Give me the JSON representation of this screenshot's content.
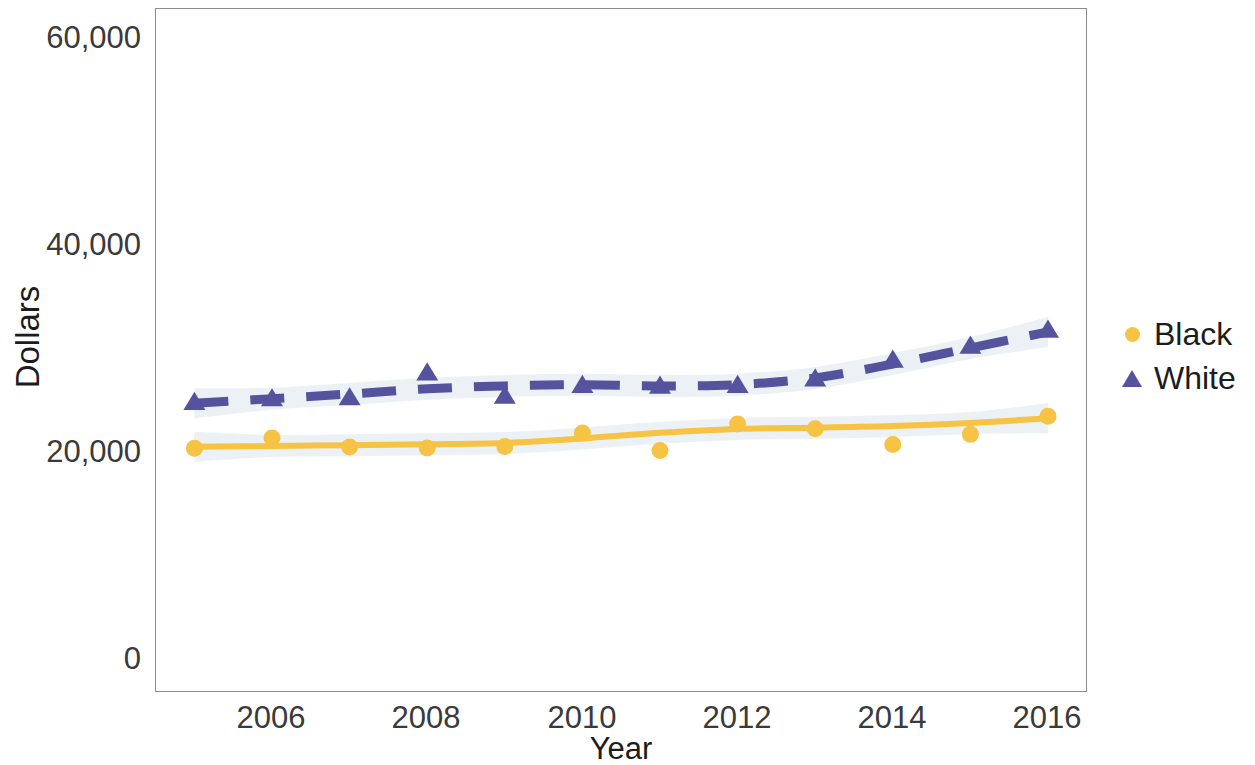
{
  "chart_data": {
    "type": "line",
    "title": "",
    "xlabel": "Year",
    "ylabel": "Dollars",
    "x": [
      2005,
      2006,
      2007,
      2008,
      2009,
      2010,
      2011,
      2012,
      2013,
      2014,
      2015,
      2016
    ],
    "xlim": [
      2004.5,
      2016.5
    ],
    "ylim": [
      0,
      62000
    ],
    "xticks": [
      "2006",
      "2008",
      "2010",
      "2012",
      "2014",
      "2016"
    ],
    "xtick_values": [
      2006,
      2008,
      2010,
      2012,
      2014,
      2016
    ],
    "yticks": [
      "0",
      "20,000",
      "40,000",
      "60,000"
    ],
    "ytick_values": [
      0,
      20000,
      40000,
      60000
    ],
    "grid": false,
    "legend_position": "right",
    "has_confidence_band": true,
    "series": [
      {
        "name": "Black",
        "marker": "circle",
        "linestyle": "solid",
        "color": "#F6C344",
        "band_color": "#E9EEF5",
        "values": [
          20450,
          21450,
          20580,
          20480,
          20620,
          21930,
          20250,
          22800,
          22350,
          20820,
          21800,
          23550
        ],
        "fit": [
          20600,
          20680,
          20760,
          20840,
          20960,
          21400,
          21950,
          22330,
          22450,
          22600,
          22900,
          23350
        ]
      },
      {
        "name": "White",
        "marker": "triangle",
        "linestyle": "dashed",
        "color": "#55539D",
        "band_color": "#E9EEF5",
        "values": [
          24900,
          25250,
          25350,
          27750,
          25500,
          26550,
          26470,
          26550,
          27180,
          28990,
          30340,
          31880
        ],
        "fit": [
          24800,
          25250,
          25700,
          26200,
          26480,
          26600,
          26480,
          26600,
          27250,
          28600,
          30150,
          31700
        ]
      }
    ]
  },
  "legend": {
    "items": [
      {
        "label": "Black",
        "color": "#F6C344",
        "marker": "circle"
      },
      {
        "label": "White",
        "color": "#55539D",
        "marker": "triangle"
      }
    ]
  },
  "axes": {
    "x_title": "Year",
    "y_title": "Dollars",
    "y_tick_labels": [
      "60,000",
      "40,000",
      "20,000",
      "0"
    ],
    "x_tick_labels": [
      "2006",
      "2008",
      "2010",
      "2012",
      "2014",
      "2016"
    ]
  }
}
